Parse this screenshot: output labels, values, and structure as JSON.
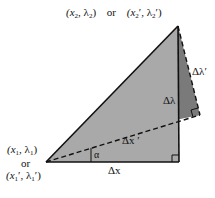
{
  "diagram": {
    "colors": {
      "background": "#ffffff",
      "main_triangle_fill": "#a9a9a9",
      "rotated_triangle_fill": "#7a7a7a",
      "stroke": "#111111"
    },
    "vertices": {
      "p1": [
        46,
        162
      ],
      "corner": [
        179,
        162
      ],
      "p2": [
        178,
        26
      ],
      "rotated_corner": [
        200,
        115
      ]
    },
    "labels": {
      "top_point": {
        "a": "(x",
        "a_sub": "2",
        "b": ", λ",
        "b_sub": "2",
        "c": ")",
        "or": "or",
        "d": "(x",
        "d_sub": "2",
        "e": "′, λ",
        "e_sub": "2",
        "f": "′)"
      },
      "bottom_point_line1": {
        "a": "(x",
        "a_sub": "1",
        "b": ", λ",
        "b_sub": "1",
        "c": ")"
      },
      "bottom_point_or": "or",
      "bottom_point_line3": {
        "a": "(x",
        "a_sub": "1",
        "b": "′, λ",
        "b_sub": "1",
        "c": "′)"
      },
      "delta_x": "Δx",
      "delta_lambda": "Δλ",
      "delta_x_prime": "Δx ′",
      "delta_lambda_prime": "Δλ′",
      "alpha": "α"
    }
  }
}
